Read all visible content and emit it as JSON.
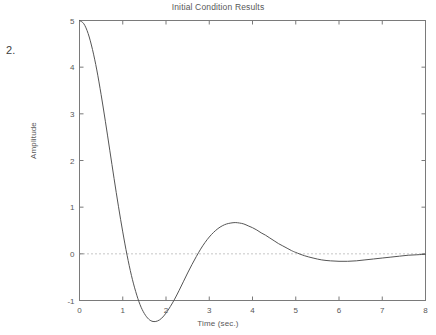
{
  "margin_note": "2.",
  "chart_data": {
    "type": "line",
    "title": "Initial Condition Results",
    "xlabel": "Time (sec.)",
    "ylabel": "Amplitude",
    "xlim": [
      0,
      8
    ],
    "ylim": [
      -1,
      5
    ],
    "xticks": [
      0,
      1,
      2,
      3,
      4,
      5,
      6,
      7,
      8
    ],
    "xticklabels": [
      "0",
      "1",
      "2",
      "3",
      "4",
      "5",
      "6",
      "7",
      "8"
    ],
    "yticks": [
      -1,
      0,
      1,
      2,
      3,
      4,
      5
    ],
    "yticklabels": [
      "-1",
      "0",
      "1",
      "2",
      "3",
      "4",
      "5"
    ],
    "grid": false,
    "legend": null,
    "box": true,
    "tick_direction": "in",
    "line_color": "#555555",
    "zero_line": {
      "value": 0,
      "style": "dotted",
      "color": "#8c8c8c"
    },
    "series": [
      {
        "name": "Initial condition response",
        "color": "#555555",
        "x": [
          0.0,
          0.1,
          0.2,
          0.3,
          0.4,
          0.5,
          0.6,
          0.7,
          0.8,
          0.9,
          1.0,
          1.1,
          1.2,
          1.3,
          1.4,
          1.5,
          1.6,
          1.7,
          1.8,
          1.9,
          2.0,
          2.1,
          2.2,
          2.3,
          2.4,
          2.5,
          2.6,
          2.7,
          2.8,
          2.9,
          3.0,
          3.1,
          3.2,
          3.3,
          3.4,
          3.5,
          3.6,
          3.7,
          3.8,
          3.9,
          4.0,
          4.1,
          4.2,
          4.3,
          4.4,
          4.5,
          4.6,
          4.7,
          4.8,
          4.9,
          5.0,
          5.2,
          5.4,
          5.6,
          5.8,
          6.0,
          6.2,
          6.4,
          6.6,
          6.8,
          7.0,
          7.2,
          7.4,
          7.6,
          7.8,
          8.0
        ],
        "y": [
          5.0,
          4.93,
          4.72,
          4.38,
          3.94,
          3.41,
          2.83,
          2.22,
          1.61,
          1.02,
          0.47,
          -0.03,
          -0.46,
          -0.81,
          -1.09,
          -1.28,
          -1.4,
          -1.45,
          -1.44,
          -1.38,
          -1.27,
          -1.13,
          -0.97,
          -0.79,
          -0.6,
          -0.41,
          -0.23,
          -0.06,
          0.1,
          0.24,
          0.36,
          0.46,
          0.54,
          0.6,
          0.64,
          0.66,
          0.67,
          0.66,
          0.64,
          0.6,
          0.56,
          0.51,
          0.45,
          0.4,
          0.34,
          0.28,
          0.22,
          0.17,
          0.12,
          0.07,
          0.03,
          -0.04,
          -0.09,
          -0.13,
          -0.15,
          -0.16,
          -0.16,
          -0.15,
          -0.13,
          -0.11,
          -0.09,
          -0.07,
          -0.05,
          -0.03,
          -0.02,
          -0.01
        ],
        "annotations": {
          "start_value": 5.0,
          "undershoot_min": -0.97,
          "undershoot_time": 2.05,
          "overshoot_max": 0.16,
          "overshoot_time": 4.3,
          "settling_value": 0.0
        }
      }
    ]
  }
}
